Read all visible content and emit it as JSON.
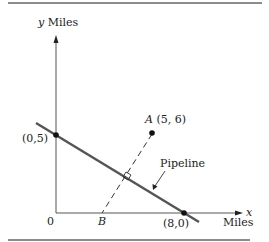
{
  "figure": {
    "y_axis_label_var": "y",
    "y_axis_label_unit": "Miles",
    "x_axis_label_var": "x",
    "x_axis_label_unit": "Miles",
    "origin_label": "0",
    "point_y_intercept_label": "(0,5)",
    "point_x_intercept_label": "(8,0)",
    "point_a_name": "A",
    "point_a_coords": "(5, 6)",
    "point_b_name": "B",
    "pipeline_label": "Pipeline"
  },
  "colors": {
    "axis": "#555555",
    "pipeline": "#555555",
    "text": "#222222",
    "rule": "#666666"
  }
}
